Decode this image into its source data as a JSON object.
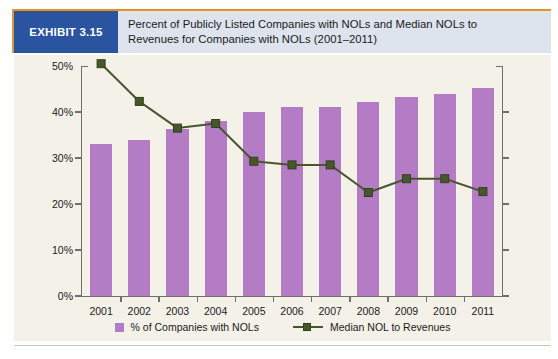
{
  "exhibit": {
    "tag": "EXHIBIT 3.15",
    "title_line1": "Percent of Publicly Listed Companies with NOLs and Median NOLs to",
    "title_line2": "Revenues for Companies with NOLs (2001–2011)",
    "tag_bg": "#2a54a0",
    "band_bg": "#dde4ed",
    "rule_color": "#e8921e",
    "panel_bg": "#f4f1e8"
  },
  "legend": {
    "position": "bottom-center",
    "items": [
      {
        "label": "% of Companies with NOLs",
        "marker": "square-swatch",
        "color": "#b57cc6"
      },
      {
        "label": "Median NOL to Revenues",
        "marker": "line-with-square",
        "color": "#4a5530"
      }
    ]
  },
  "chart_data": {
    "type": "bar",
    "title": "Percent of Publicly Listed Companies with NOLs and Median NOLs to Revenues for Companies with NOLs (2001–2011)",
    "xlabel": "",
    "ylabel": "",
    "ylim": [
      0,
      50
    ],
    "ytick_labels": [
      "0%",
      "10%",
      "20%",
      "30%",
      "40%",
      "50%"
    ],
    "ytick_values": [
      0,
      10,
      20,
      30,
      40,
      50
    ],
    "grid": false,
    "categories": [
      "2001",
      "2002",
      "2003",
      "2004",
      "2005",
      "2006",
      "2007",
      "2008",
      "2009",
      "2010",
      "2011"
    ],
    "series": [
      {
        "name": "% of Companies with NOLs",
        "type": "bar",
        "color": "#b57cc6",
        "values": [
          33.0,
          34.0,
          36.3,
          38.0,
          40.0,
          41.0,
          41.0,
          42.2,
          43.2,
          44.0,
          45.3
        ]
      },
      {
        "name": "Median NOL to Revenues",
        "type": "line",
        "color": "#4a5530",
        "marker_color": "#46582b",
        "values": [
          50.5,
          42.3,
          36.5,
          37.5,
          29.3,
          28.5,
          28.5,
          22.5,
          25.5,
          25.5,
          22.7
        ]
      }
    ]
  }
}
